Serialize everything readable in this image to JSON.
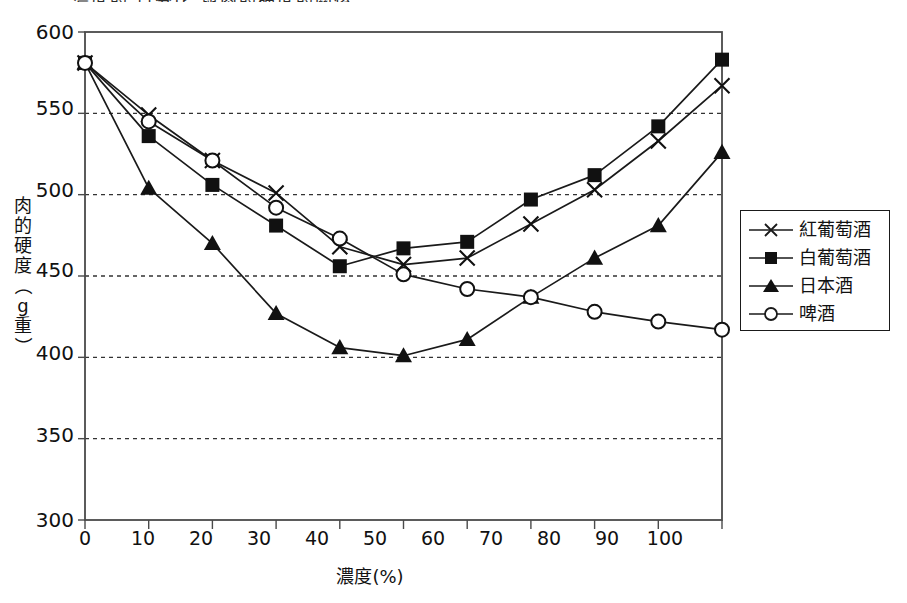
{
  "title_partial": "濃度的 百分比 與肉的硬度的關係",
  "axes": {
    "x_title": "濃度(%)",
    "y_title_chars": [
      "肉",
      "的",
      "硬",
      "度",
      "（",
      "g",
      "重",
      "）"
    ],
    "y_ticks": [
      "600",
      "550",
      "500",
      "450",
      "400",
      "350",
      "300"
    ],
    "x_ticks": [
      "0",
      "10",
      "20",
      "30",
      "40",
      "50",
      "60",
      "70",
      "80",
      "90",
      "100"
    ]
  },
  "legend": {
    "items": [
      {
        "label": "紅葡萄酒",
        "marker": "x-marker",
        "name": "legend-item-red-wine"
      },
      {
        "label": "白葡萄酒",
        "marker": "filled-square-marker",
        "name": "legend-item-white-wine"
      },
      {
        "label": "日本酒",
        "marker": "filled-triangle-marker",
        "name": "legend-item-sake"
      },
      {
        "label": "啤酒",
        "marker": "open-circle-marker",
        "name": "legend-item-beer"
      }
    ]
  },
  "colors": {
    "line": "#1a1a1a",
    "grid": "#333333",
    "frame": "#4a4a4a",
    "background": "#ffffff"
  },
  "chart_data": {
    "type": "line",
    "title": "濃度的 百分比 與肉的硬度的關係",
    "xlabel": "濃度(%)",
    "ylabel": "肉的硬度（g重）",
    "xlim": [
      0,
      100
    ],
    "ylim": [
      300,
      600
    ],
    "grid": true,
    "legend_position": "right",
    "x": [
      0,
      10,
      20,
      30,
      40,
      50,
      60,
      70,
      80,
      90,
      100
    ],
    "series": [
      {
        "name": "紅葡萄酒",
        "marker": "x",
        "values": [
          581,
          549,
          521,
          501,
          468,
          457,
          461,
          482,
          503,
          533,
          567
        ]
      },
      {
        "name": "白葡萄酒",
        "marker": "filled-square",
        "values": [
          581,
          536,
          506,
          481,
          456,
          467,
          471,
          497,
          512,
          542,
          583
        ]
      },
      {
        "name": "日本酒",
        "marker": "filled-triangle",
        "values": [
          581,
          504,
          470,
          427,
          406,
          401,
          411,
          437,
          461,
          481,
          526
        ]
      },
      {
        "name": "啤酒",
        "marker": "open-circle",
        "values": [
          581,
          545,
          521,
          492,
          473,
          451,
          442,
          437,
          428,
          422,
          417
        ]
      }
    ]
  }
}
